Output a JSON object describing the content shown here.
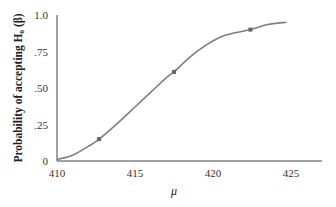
{
  "chart_data": {
    "type": "line",
    "title": "",
    "xlabel": "μ",
    "ylabel": "Probability of accepting H₀ (β)",
    "xlim": [
      410,
      427
    ],
    "ylim": [
      0,
      1.0
    ],
    "x_ticks": [
      410,
      415,
      420,
      425
    ],
    "x_tick_labels": [
      "410",
      "415",
      "420",
      "425"
    ],
    "y_ticks": [
      0,
      0.25,
      0.5,
      0.75,
      1.0
    ],
    "y_tick_labels": [
      "0",
      ".25",
      ".50",
      ".75",
      "1.0"
    ],
    "grid": false,
    "series": [
      {
        "name": "OC curve",
        "color": "#7f7f7f",
        "curve": [
          {
            "x": 410.0,
            "y": 0.01
          },
          {
            "x": 411.0,
            "y": 0.04
          },
          {
            "x": 412.0,
            "y": 0.1
          },
          {
            "x": 412.7,
            "y": 0.15
          },
          {
            "x": 414.0,
            "y": 0.27
          },
          {
            "x": 415.0,
            "y": 0.37
          },
          {
            "x": 416.0,
            "y": 0.47
          },
          {
            "x": 417.0,
            "y": 0.57
          },
          {
            "x": 417.5,
            "y": 0.61
          },
          {
            "x": 418.5,
            "y": 0.71
          },
          {
            "x": 419.5,
            "y": 0.79
          },
          {
            "x": 420.5,
            "y": 0.85
          },
          {
            "x": 421.5,
            "y": 0.88
          },
          {
            "x": 422.4,
            "y": 0.9
          },
          {
            "x": 423.5,
            "y": 0.935
          },
          {
            "x": 424.7,
            "y": 0.95
          }
        ],
        "markers": [
          {
            "x": 412.7,
            "y": 0.15
          },
          {
            "x": 417.5,
            "y": 0.61
          },
          {
            "x": 422.4,
            "y": 0.9
          }
        ]
      }
    ]
  }
}
